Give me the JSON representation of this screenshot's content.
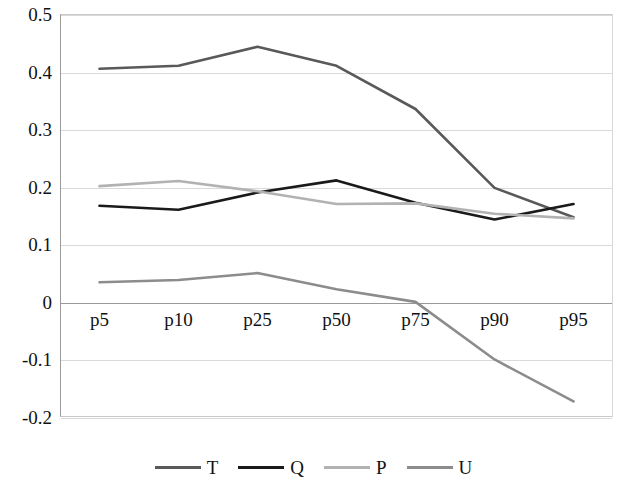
{
  "chart_data": {
    "type": "line",
    "title": "",
    "subtitle": "",
    "xlabel": "",
    "ylabel": "",
    "categories": [
      "p5",
      "p10",
      "p25",
      "p50",
      "p75",
      "p90",
      "p95"
    ],
    "ylim": [
      -0.2,
      0.5
    ],
    "yticks": [
      "0.5",
      "0.4",
      "0.3",
      "0.2",
      "0.1",
      "0",
      "-0.1",
      "-0.2"
    ],
    "ytick_values": [
      0.5,
      0.4,
      0.3,
      0.2,
      0.1,
      0,
      -0.1,
      -0.2
    ],
    "grid": true,
    "legend_position": "bottom",
    "series": [
      {
        "name": "T",
        "color": "#595959",
        "values": [
          0.405,
          0.41,
          0.443,
          0.41,
          0.335,
          0.198,
          0.147
        ]
      },
      {
        "name": "Q",
        "color": "#1a1a1a",
        "values": [
          0.167,
          0.16,
          0.19,
          0.211,
          0.172,
          0.143,
          0.17
        ]
      },
      {
        "name": "P",
        "color": "#b2b2b2",
        "values": [
          0.201,
          0.21,
          0.192,
          0.17,
          0.171,
          0.153,
          0.145
        ]
      },
      {
        "name": "U",
        "color": "#8c8c8c",
        "values": [
          0.034,
          0.038,
          0.05,
          0.022,
          0.0,
          -0.1,
          -0.173
        ]
      }
    ]
  },
  "legend": {
    "items": [
      {
        "label": "T",
        "color": "#595959"
      },
      {
        "label": "Q",
        "color": "#1a1a1a"
      },
      {
        "label": "P",
        "color": "#b2b2b2"
      },
      {
        "label": "U",
        "color": "#8c8c8c"
      }
    ]
  },
  "axes": {
    "y_tick_labels": [
      "0.5",
      "0.4",
      "0.3",
      "0.2",
      "0.1",
      "0",
      "-0.1",
      "-0.2"
    ],
    "x_tick_labels": [
      "p5",
      "p10",
      "p25",
      "p50",
      "p75",
      "p90",
      "p95"
    ]
  }
}
